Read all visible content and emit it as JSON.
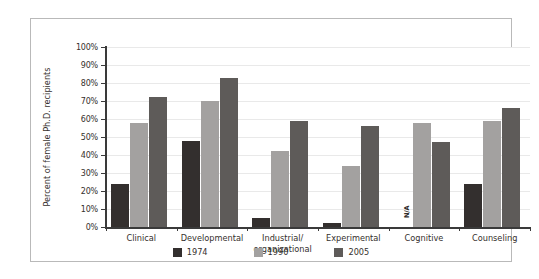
{
  "chart_data": {
    "type": "bar",
    "title": "",
    "xlabel": "",
    "ylabel": "Percent of female Ph.D. recipients",
    "ylim": [
      0,
      100
    ],
    "ytick_labels": [
      "100%",
      "90%",
      "80%",
      "70%",
      "60%",
      "50%",
      "40%",
      "30%",
      "20%",
      "10%",
      "0%"
    ],
    "ytick_values": [
      100,
      90,
      80,
      70,
      60,
      50,
      40,
      30,
      20,
      10,
      0
    ],
    "grid": true,
    "legend_position": "bottom",
    "categories": [
      "Clinical",
      "Developmental",
      "Industrial/\norganizational",
      "Experimental",
      "Cognitive",
      "Counseling"
    ],
    "series": [
      {
        "name": "1974",
        "color": "#332f2e",
        "values": [
          24,
          48,
          5,
          2,
          null,
          24
        ]
      },
      {
        "name": "1990",
        "color": "#a3a1a0",
        "values": [
          58,
          70,
          42,
          34,
          58,
          59
        ]
      },
      {
        "name": "2005",
        "color": "#5e5b59",
        "values": [
          72,
          83,
          59,
          56,
          47,
          66
        ]
      }
    ],
    "annotations": [
      {
        "text": "N/A",
        "series": "1974",
        "category": "Cognitive",
        "rotation": 90
      }
    ]
  },
  "categories": [
    {
      "label_line1": "Clinical",
      "label_line2": ""
    },
    {
      "label_line1": "Developmental",
      "label_line2": ""
    },
    {
      "label_line1": "Industrial/",
      "label_line2": "organizational"
    },
    {
      "label_line1": "Experimental",
      "label_line2": ""
    },
    {
      "label_line1": "Cognitive",
      "label_line2": ""
    },
    {
      "label_line1": "Counseling",
      "label_line2": ""
    }
  ],
  "axis": {
    "y_title": "Percent of female Ph.D. recipients",
    "ticks": [
      "100%",
      "90%",
      "80%",
      "70%",
      "60%",
      "50%",
      "40%",
      "30%",
      "20%",
      "10%",
      "0%"
    ]
  },
  "legend": {
    "items": [
      {
        "label": "1974",
        "color": "#332f2e"
      },
      {
        "label": "1990",
        "color": "#a3a1a0"
      },
      {
        "label": "2005",
        "color": "#5e5b59"
      }
    ]
  },
  "na_text": "N/A",
  "colors": {
    "series_1974": "#332f2e",
    "series_1990": "#a3a1a0",
    "series_2005": "#5e5b59",
    "gridline": "#e9e9e9",
    "axis": "#3a3a3a",
    "panel_border": "#b9b9b9",
    "background": "#ffffff",
    "text": "#35302d"
  }
}
